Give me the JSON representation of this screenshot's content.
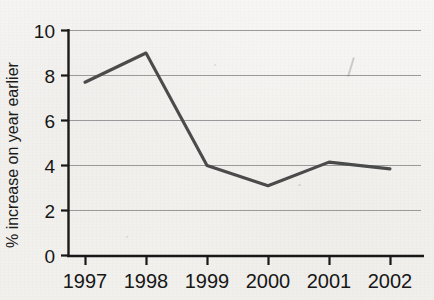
{
  "chart_data": {
    "type": "line",
    "title": "",
    "subtitle": "",
    "xlabel": "",
    "ylabel": "% increase on year earlier",
    "categories": [
      "1997",
      "1998",
      "1999",
      "2000",
      "2001",
      "2002"
    ],
    "x": [
      1997,
      1998,
      1999,
      2000,
      2001,
      2002
    ],
    "values": [
      7.7,
      9.0,
      4.0,
      3.1,
      4.15,
      3.85
    ],
    "series": [
      {
        "name": "% increase on year earlier",
        "values": [
          7.7,
          9.0,
          4.0,
          3.1,
          4.15,
          3.85
        ]
      }
    ],
    "ylim": [
      0,
      10
    ],
    "yticks": [
      0,
      2,
      4,
      6,
      8,
      10
    ],
    "ytick_labels": [
      "0",
      "2",
      "4",
      "6",
      "8",
      "10"
    ],
    "xtick_labels": [
      "1997",
      "1998",
      "1999",
      "2000",
      "2001",
      "2002"
    ],
    "grid": true,
    "grid_axis": "y",
    "legend": false,
    "legend_position": "none",
    "line_color": "#4a4a4a",
    "grid_color": "#9a9a9a",
    "axis_color": "#1a1a1a",
    "background_color": "#f4f3f1",
    "text_color": "#151515"
  },
  "axis": {
    "y_title": "% increase on year earlier",
    "y_tick_0": "0",
    "y_tick_1": "2",
    "y_tick_2": "4",
    "y_tick_3": "6",
    "y_tick_4": "8",
    "y_tick_5": "10",
    "x_tick_0": "1997",
    "x_tick_1": "1998",
    "x_tick_2": "1999",
    "x_tick_3": "2000",
    "x_tick_4": "2001",
    "x_tick_5": "2002"
  }
}
